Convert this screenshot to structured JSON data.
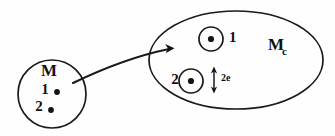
{
  "diagram": {
    "source_set": {
      "name": "source-set-M",
      "label": "M",
      "shape": "circle",
      "elements": [
        {
          "label": "1",
          "marker": "dot"
        },
        {
          "label": "2",
          "marker": "dot"
        }
      ]
    },
    "target_set": {
      "name": "target-set-Mc",
      "label": "M",
      "subscript": "c",
      "shape": "ellipse",
      "elements": [
        {
          "label": "1",
          "marker": "circled-dot",
          "label_side": "right"
        },
        {
          "label": "2",
          "marker": "circled-dot",
          "label_side": "left"
        }
      ],
      "measure": {
        "label": "2e",
        "marker": "double-headed-arrow",
        "orientation": "vertical"
      }
    },
    "mapping_arrow": {
      "name": "mapping-arrow",
      "from": "M",
      "to": "Mc",
      "style": "curved-arrow"
    },
    "colors": {
      "ink": "#1a1a1a",
      "background": "#ffffff"
    }
  }
}
